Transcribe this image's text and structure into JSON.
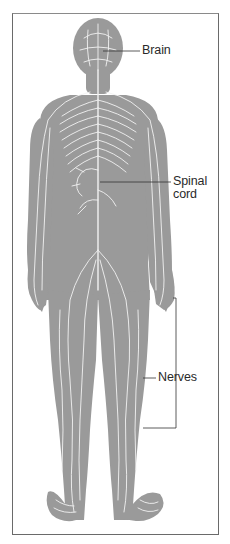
{
  "diagram": {
    "colors": {
      "body": "#9a9a9a",
      "nerve": "#f2f2f2",
      "leader_line": "#333333",
      "frame": "#6a6a6a",
      "label_text": "#2a2a2a"
    },
    "labels": [
      {
        "id": "brain",
        "text": "Brain"
      },
      {
        "id": "spinal_cord",
        "line1": "Spinal",
        "line2": "cord"
      },
      {
        "id": "nerves",
        "text": "Nerves"
      }
    ]
  }
}
